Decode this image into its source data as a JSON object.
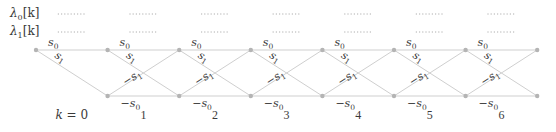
{
  "diagram": {
    "row_labels": [
      {
        "id": "lambda0",
        "text": "λ",
        "sub": "0",
        "suffix": "[k]"
      },
      {
        "id": "lambda1",
        "text": "λ",
        "sub": "1",
        "suffix": "[k]"
      }
    ],
    "stage_labels": [
      "k = 0",
      "1",
      "2",
      "3",
      "4",
      "5",
      "6"
    ],
    "edge_labels": {
      "top_horizontal": {
        "text": "s",
        "sub": "0"
      },
      "top_diagonal": {
        "text": "s",
        "sub": "1"
      },
      "bottom_diagonal": {
        "text": "−s",
        "sub": "1"
      },
      "bottom_horizontal": {
        "text": "−s",
        "sub": "0"
      }
    },
    "placeholder": "........",
    "states": [
      "s0",
      "−s0"
    ],
    "num_stages": 7,
    "colors": {
      "edge": "#cfcfcf",
      "node": "#b4b4b4",
      "text": "#3a3a3a"
    }
  }
}
